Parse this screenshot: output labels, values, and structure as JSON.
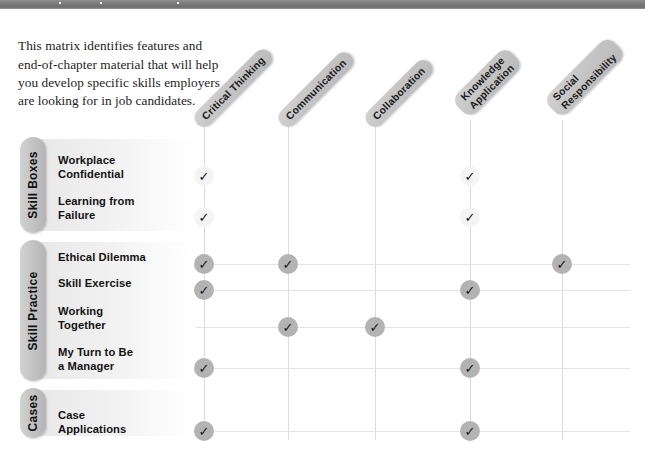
{
  "topbar": {
    "color": "#7a7a7a"
  },
  "intro": {
    "text": "This matrix identifies features and end-of-chapter material that will help you develop specific skills employers are looking for in job candidates."
  },
  "columns": [
    {
      "id": "critical-thinking",
      "lines": [
        "Critical Thinking"
      ],
      "x": 204
    },
    {
      "id": "communication",
      "lines": [
        "Communication"
      ],
      "x": 288
    },
    {
      "id": "collaboration",
      "lines": [
        "Collaboration"
      ],
      "x": 375
    },
    {
      "id": "knowledge-application",
      "lines": [
        "Knowledge",
        "Application"
      ],
      "x": 470
    },
    {
      "id": "social-responsibility",
      "lines": [
        "Social",
        "Responsibility"
      ],
      "x": 562
    }
  ],
  "groups": [
    {
      "id": "skill-boxes",
      "label": "Skill Boxes",
      "top": 137,
      "height": 96
    },
    {
      "id": "skill-practice",
      "label": "Skill Practice",
      "top": 240,
      "height": 141
    },
    {
      "id": "cases",
      "label": "Cases",
      "top": 388,
      "height": 50
    }
  ],
  "rows": [
    {
      "id": "workplace-confidential",
      "label": "Workplace\nConfidential",
      "group": "skill-boxes",
      "y": 167,
      "checks": [
        true,
        false,
        false,
        true,
        false
      ],
      "style": "light"
    },
    {
      "id": "learning-from-failure",
      "label": "Learning from\nFailure",
      "group": "skill-boxes",
      "y": 208,
      "checks": [
        true,
        false,
        false,
        true,
        false
      ],
      "style": "light"
    },
    {
      "id": "ethical-dilemma",
      "label": "Ethical Dilemma",
      "group": "skill-practice",
      "y": 255,
      "checks": [
        true,
        true,
        false,
        false,
        true
      ],
      "style": "dark"
    },
    {
      "id": "skill-exercise",
      "label": "Skill Exercise",
      "group": "skill-practice",
      "y": 281,
      "checks": [
        true,
        false,
        false,
        true,
        false
      ],
      "style": "dark"
    },
    {
      "id": "working-together",
      "label": "Working\nTogether",
      "group": "skill-practice",
      "y": 318,
      "checks": [
        false,
        true,
        true,
        false,
        false
      ],
      "style": "dark"
    },
    {
      "id": "my-turn-to-be-a-manager",
      "label": "My Turn to Be\na Manager",
      "group": "skill-practice",
      "y": 359,
      "checks": [
        true,
        false,
        false,
        true,
        false
      ],
      "style": "dark"
    },
    {
      "id": "case-applications",
      "label": "Case\nApplications",
      "group": "cases",
      "y": 422,
      "checks": [
        true,
        false,
        false,
        true,
        false
      ],
      "style": "dark"
    }
  ],
  "check_glyph": "✓"
}
